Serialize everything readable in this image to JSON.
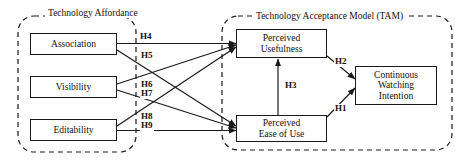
{
  "diagram": {
    "type": "conceptual-research-model",
    "groups": [
      {
        "id": "technology-affordance",
        "label": "Technology\nAffordance",
        "label_line1": "Technology",
        "label_line2": "Affordance",
        "border_style": "dashed",
        "border_color": "#1a1a1a"
      },
      {
        "id": "tam",
        "label": "Technology Acceptance Model (TAM)",
        "border_style": "dashed",
        "border_color": "#1a1a1a"
      }
    ],
    "nodes": [
      {
        "id": "association",
        "label": "Association",
        "group": "technology-affordance"
      },
      {
        "id": "visibility",
        "label": "Visibility",
        "group": "technology-affordance"
      },
      {
        "id": "editability",
        "label": "Editability",
        "group": "technology-affordance"
      },
      {
        "id": "perceived-usefulness",
        "label_line1": "Perceived",
        "label_line2": "Usefulness",
        "group": "tam"
      },
      {
        "id": "perceived-ease-of-use",
        "label_line1": "Perceived",
        "label_line2": "Ease of Use",
        "group": "tam"
      },
      {
        "id": "continuous-watching-intention",
        "label_line1": "Continuous",
        "label_line2": "Watching",
        "label_line3": "Intention",
        "group": "tam"
      }
    ],
    "edges": [
      {
        "id": "h1",
        "label": "H1",
        "from": "perceived-ease-of-use",
        "to": "continuous-watching-intention"
      },
      {
        "id": "h2",
        "label": "H2",
        "from": "perceived-usefulness",
        "to": "continuous-watching-intention"
      },
      {
        "id": "h3",
        "label": "H3",
        "from": "perceived-ease-of-use",
        "to": "perceived-usefulness"
      },
      {
        "id": "h4",
        "label": "H4",
        "from": "association",
        "to": "perceived-usefulness"
      },
      {
        "id": "h5",
        "label": "H5",
        "from": "association",
        "to": "perceived-ease-of-use"
      },
      {
        "id": "h6",
        "label": "H6",
        "from": "visibility",
        "to": "perceived-usefulness"
      },
      {
        "id": "h7",
        "label": "H7",
        "from": "visibility",
        "to": "perceived-ease-of-use"
      },
      {
        "id": "h8",
        "label": "H8",
        "from": "editability",
        "to": "perceived-usefulness"
      },
      {
        "id": "h9",
        "label": "H9",
        "from": "editability",
        "to": "perceived-ease-of-use"
      }
    ],
    "colors": {
      "line": "#1a1a1a",
      "box_border": "#1a1a1a",
      "background": "#ffffff",
      "text": "#111111"
    }
  }
}
